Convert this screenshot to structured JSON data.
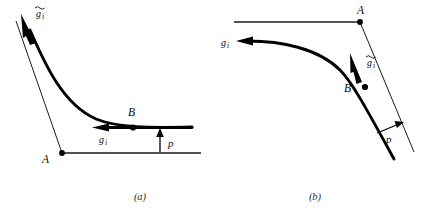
{
  "figure": {
    "panels": [
      {
        "id": "panel-a",
        "caption": "(a)",
        "labels": {
          "point_a": "A",
          "point_b": "B",
          "vector_g_tilde": "g",
          "vector_g_tilde_sub": "i",
          "vector_g": "g",
          "vector_g_sub": "i",
          "pressure": "p"
        }
      },
      {
        "id": "panel-b",
        "caption": "(b)",
        "labels": {
          "point_a": "A",
          "point_b": "B",
          "vector_g_tilde": "g",
          "vector_g_tilde_sub": "i",
          "vector_g": "g",
          "vector_g_sub": "i",
          "pressure": "p"
        }
      }
    ],
    "colors": {
      "ink": "#000000",
      "thin_ink": "#1a1a1a",
      "background": "#ffffff",
      "caption_ink": "#2a2a2a"
    }
  }
}
